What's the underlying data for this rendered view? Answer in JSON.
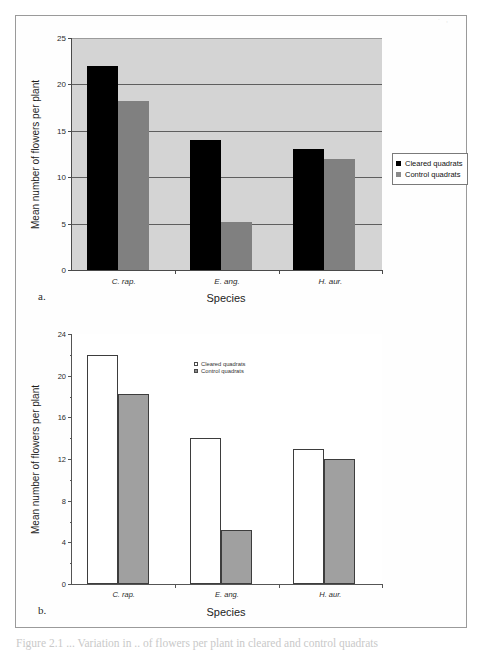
{
  "scan": {
    "header_fragment": "· ,"
  },
  "figure": {
    "caption": "Figure 2.1 ... Variation in .. of flowers per plant in cleared and control quadrats"
  },
  "panels": [
    {
      "key": "a",
      "panel_label": "a.",
      "legend_position": "right-outside"
    },
    {
      "key": "b",
      "panel_label": "b.",
      "legend_position": "inside-upper-center"
    }
  ],
  "chart_data": [
    {
      "panel": "a",
      "type": "bar",
      "title": "",
      "xlabel": "Species",
      "ylabel": "Mean number of flowers per plant",
      "categories": [
        "C. rap.",
        "E. ang.",
        "H. aur."
      ],
      "series": [
        {
          "name": "Cleared quadrats",
          "color": "#000000",
          "values": [
            22,
            14,
            13
          ]
        },
        {
          "name": "Control quadrats",
          "color": "#808080",
          "values": [
            18.2,
            5.2,
            12
          ]
        }
      ],
      "ylim": [
        0,
        25
      ],
      "yticks": [
        0,
        5,
        10,
        15,
        20,
        25
      ],
      "grid": true,
      "plot_background": "#d4d4d4",
      "legend": [
        "Cleared quadrats",
        "Control quadrats"
      ]
    },
    {
      "panel": "b",
      "type": "bar",
      "title": "",
      "xlabel": "Species",
      "ylabel": "Mean number of flowers per plant",
      "categories": [
        "C. rap.",
        "E. ang.",
        "H. aur."
      ],
      "series": [
        {
          "name": "Cleared quadrats",
          "color": "#ffffff",
          "values": [
            22,
            14,
            13
          ]
        },
        {
          "name": "Control quadrats",
          "color": "#a0a0a0",
          "values": [
            18.2,
            5.2,
            12
          ]
        }
      ],
      "ylim": [
        0,
        24
      ],
      "yticks": [
        0,
        4,
        8,
        12,
        16,
        20,
        24
      ],
      "yminorticks": [
        2,
        6,
        10,
        14,
        18,
        22
      ],
      "grid": false,
      "plot_background": "#ffffff",
      "legend": [
        "Cleared quadrats",
        "Control quadrats"
      ]
    }
  ]
}
